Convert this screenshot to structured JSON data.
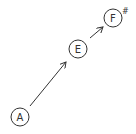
{
  "diagram": {
    "nodes": [
      {
        "id": "A",
        "label": "A",
        "cx": 20,
        "cy": 117
      },
      {
        "id": "E",
        "label": "E",
        "cx": 78,
        "cy": 49
      },
      {
        "id": "Fs",
        "label": "F",
        "accidental": "#",
        "cx": 113,
        "cy": 18
      }
    ],
    "edges": [
      {
        "from": "A",
        "to": "E"
      },
      {
        "from": "E",
        "to": "Fs"
      }
    ],
    "stroke_color": "#333333"
  }
}
